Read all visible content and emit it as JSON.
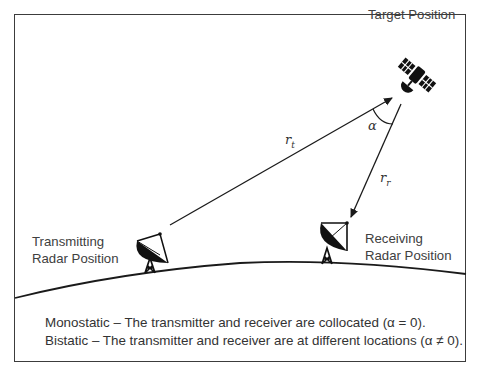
{
  "labels": {
    "target": "Target Position",
    "transmitting_line1": "Transmitting",
    "transmitting_line2": "Radar Position",
    "receiving_line1": "Receiving",
    "receiving_line2": "Radar Position"
  },
  "symbols": {
    "r_t": "r",
    "r_t_sub": "t",
    "r_r": "r",
    "r_r_sub": "r",
    "alpha": "α"
  },
  "caption": {
    "line1": "Monostatic – The transmitter and receiver are collocated (α = 0).",
    "line2": "Bistatic – The transmitter and receiver are at different locations (α ≠ 0)."
  },
  "icons": {
    "target": "satellite-icon",
    "transmitter": "radar-dish-icon",
    "receiver": "radar-dish-icon"
  },
  "colors": {
    "line": "#1a1a1a",
    "text": "#404040",
    "border": "#3c3c3c"
  }
}
